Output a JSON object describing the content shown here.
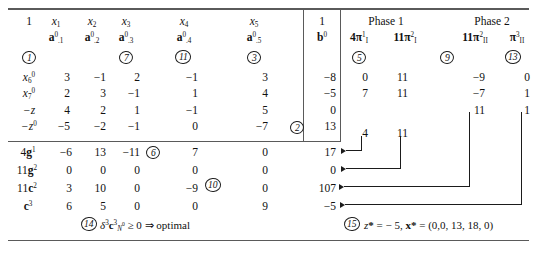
{
  "figure": {
    "type": "table"
  },
  "top_rule": "",
  "column_headers": {
    "one_left": "1",
    "vars": [
      "x",
      "x",
      "x",
      "x",
      "x"
    ],
    "var_subs": [
      "1",
      "2",
      "3",
      "4",
      "5"
    ],
    "a_sym": "a",
    "a_sups": [
      "0",
      "0",
      "0",
      "0",
      "0"
    ],
    "a_subs": [
      ".1",
      ".2",
      ".3",
      ".4",
      ".5"
    ],
    "one_right": "1",
    "b_sym": "b",
    "b_sup": "0"
  },
  "phases": {
    "phase1_label": "Phase 1",
    "phase2_label": "Phase 2",
    "cols": [
      {
        "coef": "4",
        "sym": "π",
        "sub": "I",
        "sup": "1"
      },
      {
        "coef": "11",
        "sym": "π",
        "sub": "I",
        "sup": "2"
      },
      {
        "coef": "11",
        "sym": "π",
        "sub": "II",
        "sup": "2"
      },
      {
        "coef": "",
        "sym": "π",
        "sub": "II",
        "sup": "3"
      }
    ]
  },
  "markers": {
    "m1": "1",
    "m7": "7",
    "m11": "11",
    "m3": "3",
    "m5": "5",
    "m9": "9",
    "m13": "13",
    "m2": "2",
    "m6": "6",
    "m10": "10",
    "m14": "14",
    "m15": "15"
  },
  "body_rows": [
    {
      "label_base": "x",
      "label_sub": "6",
      "label_sup": "0",
      "values": [
        "3",
        "−1",
        "2",
        "−1",
        "3",
        "−8"
      ],
      "phase": [
        "0",
        "11",
        "−9",
        "0"
      ]
    },
    {
      "label_base": "x",
      "label_sub": "7",
      "label_sup": "0",
      "values": [
        "2",
        "3",
        "−1",
        "1",
        "4",
        "−5"
      ],
      "phase": [
        "7",
        "11",
        "−7",
        "1"
      ]
    },
    {
      "label_base": "−z",
      "label_sub": "",
      "label_sup": "",
      "values": [
        "4",
        "2",
        "1",
        "−1",
        "5",
        "0"
      ],
      "phase": [
        "",
        "",
        "11",
        "1"
      ]
    },
    {
      "label_base": "−z",
      "label_sub": "",
      "label_sup": "0",
      "values": [
        "−5",
        "−2",
        "−1",
        "0",
        "−7",
        "13"
      ],
      "phase": [
        "4",
        "11",
        "",
        ""
      ]
    }
  ],
  "lower_rows": [
    {
      "label_coef": "4",
      "label_sym": "g",
      "label_sup": "1",
      "values": [
        "−6",
        "13",
        "−11",
        "7",
        "0",
        "17"
      ]
    },
    {
      "label_coef": "11",
      "label_sym": "g",
      "label_sup": "2",
      "values": [
        "0",
        "0",
        "0",
        "0",
        "0",
        "0"
      ]
    },
    {
      "label_coef": "11",
      "label_sym": "c",
      "label_sup": "2",
      "values": [
        "3",
        "10",
        "0",
        "−9",
        "0",
        "107"
      ]
    },
    {
      "label_coef": "",
      "label_sym": "c",
      "label_sup": "3",
      "values": [
        "6",
        "5",
        "0",
        "0",
        "9",
        "−5"
      ]
    }
  ],
  "annotations": {
    "optimal": {
      "delta": "δ",
      "delta_sup": "3",
      "c_sym": "c",
      "c_sup": "3",
      "c_sub": "N",
      "c_sub_sup": "0",
      "tail": "≥ 0 ⇒ optimal"
    },
    "solution": {
      "z_sym": "z",
      "star": "*",
      "z_value": "− 5",
      "x_sym": "x",
      "x_value": "(0,0, 13, 18, 0)",
      "eq": "=",
      "comma": ", "
    }
  },
  "colors": {
    "ink": "#111111",
    "rule": "#5a5a5a",
    "background": "#ffffff"
  }
}
